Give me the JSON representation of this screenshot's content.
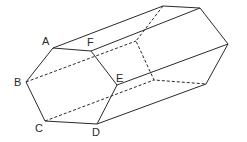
{
  "diagram": {
    "type": "hexagonal-prism",
    "front_face": {
      "A": [
        53,
        48
      ],
      "F": [
        91,
        51
      ],
      "E": [
        117,
        85
      ],
      "D": [
        97,
        124
      ],
      "C": [
        45,
        121
      ],
      "B": [
        26,
        82
      ]
    },
    "back_face": {
      "A": [
        163,
        6
      ],
      "F": [
        200,
        8
      ],
      "E": [
        228,
        44
      ],
      "D": [
        206,
        84
      ],
      "C": [
        154,
        80
      ],
      "B": [
        136,
        41
      ]
    },
    "labels": [
      {
        "text": "A",
        "x": 42,
        "y": 45
      },
      {
        "text": "F",
        "x": 87,
        "y": 46
      },
      {
        "text": "E",
        "x": 116,
        "y": 82
      },
      {
        "text": "D",
        "x": 92,
        "y": 136
      },
      {
        "text": "C",
        "x": 35,
        "y": 132
      },
      {
        "text": "B",
        "x": 14,
        "y": 86
      }
    ]
  }
}
